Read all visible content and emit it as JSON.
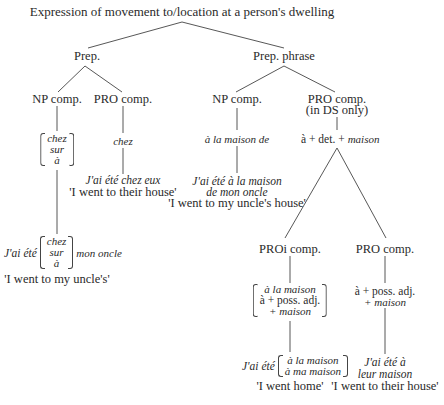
{
  "diagram": {
    "title": "Expression of movement to/location at a person's dwelling",
    "nodes": {
      "prep": "Prep.",
      "prep_phrase": "Prep. phrase",
      "prep_np_comp": "NP comp.",
      "prep_pro_comp": "PRO comp.",
      "pp_np_comp": "NP comp.",
      "pp_pro_comp": "PRO comp.",
      "pp_pro_comp_note": "(in DS only)",
      "proi_comp": "PROi comp.",
      "pro_comp_2": "PRO comp."
    },
    "prep_np": {
      "options": [
        "chez",
        "sur",
        "à"
      ],
      "example_prefix": "J'ai été",
      "example_options": [
        "chez",
        "sur",
        "à"
      ],
      "example_suffix": "mon oncle",
      "gloss": "'I went to my uncle's'"
    },
    "prep_pro": {
      "form": "chez",
      "example": "J'ai été chez eux",
      "gloss": "'I went to their house'"
    },
    "pp_np": {
      "form": "à la maison de",
      "example_line1": "J'ai été à la maison",
      "example_line2": "de mon oncle",
      "gloss": "'I went to my uncle's house'"
    },
    "pp_pro": {
      "form_a": "à + det. +",
      "form_b": "maison"
    },
    "proi": {
      "options": [
        "à la maison",
        "à + poss. adj.",
        "+ maison"
      ],
      "example_prefix": "J'ai été",
      "example_options": [
        "à la maison",
        "à ma maison"
      ],
      "gloss": "'I went home'"
    },
    "pro2": {
      "form_line1": "à + poss. adj.",
      "form_line2": "+ maison",
      "example_line1": "J'ai été à",
      "example_line2": "leur maison",
      "gloss": "'I went to their house'"
    }
  }
}
